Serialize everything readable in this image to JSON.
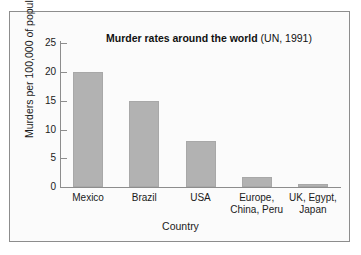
{
  "figure": {
    "background": "#fbfbfb",
    "border_color": "#8d8d8d",
    "bar_color": "#b2b2b2"
  },
  "title": {
    "main": "Murder rates around the world",
    "source": " (UN, 1991)"
  },
  "axes": {
    "x_title": "Country",
    "y_title": "Murders per 100,000 of population"
  },
  "chart_data": {
    "type": "bar",
    "title": "Murder rates around the world (UN, 1991)",
    "xlabel": "Country",
    "ylabel": "Murders per 100,000 of population",
    "categories": [
      "Mexico",
      "Brazil",
      "USA",
      "Europe,\nChina, Peru",
      "UK, Egypt,\nJapan"
    ],
    "values": [
      20,
      15,
      8,
      1.7,
      0.6
    ],
    "ylim": [
      0,
      25
    ],
    "yticks": [
      0,
      5,
      10,
      15,
      20,
      25
    ],
    "ytick_labels": [
      "0",
      "5",
      "10",
      "15",
      "20",
      "25"
    ],
    "grid": false,
    "legend": null
  }
}
